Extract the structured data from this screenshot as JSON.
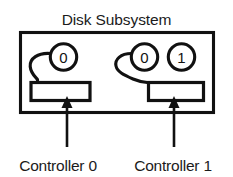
{
  "diagram": {
    "title": "Disk Subsystem",
    "type": "block-diagram",
    "background_color": "#ffffff",
    "line_color": "#111111",
    "text_color": "#1b1b1b",
    "enclosure": {
      "name": "Disk Subsystem",
      "shape": "rectangle"
    },
    "controllers": [
      {
        "label": "Controller 0",
        "shape": "rectangle",
        "ports": [
          {
            "number": "0",
            "shape": "circle",
            "cabled": true
          }
        ]
      },
      {
        "label": "Controller 1",
        "shape": "rectangle",
        "ports": [
          {
            "number": "0",
            "shape": "circle",
            "cabled": true
          },
          {
            "number": "1",
            "shape": "circle",
            "cabled": false
          }
        ]
      }
    ],
    "callouts": [
      {
        "label": "Controller 0",
        "pointer": "arrow-up"
      },
      {
        "label": "Controller 1",
        "pointer": "arrow-up"
      }
    ]
  }
}
